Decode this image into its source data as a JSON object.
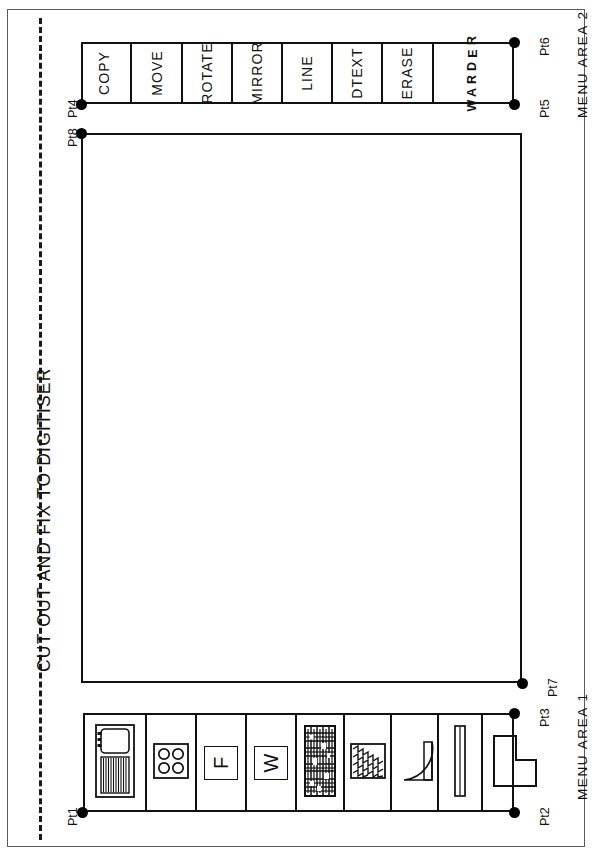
{
  "sheet": {
    "cut_instruction": "CUT OUT AND FIX TO DIGITISER",
    "screen_area_label": "SCREEN DRAWING AREA",
    "menu_area_1_label": "MENU  AREA  1",
    "menu_area_2_label": "MENU  AREA  2",
    "border_color": "#5a5a5a",
    "line_color": "#111111",
    "background": "#ffffff"
  },
  "calibration_points": [
    {
      "id": "pt1",
      "label": "Pt1"
    },
    {
      "id": "pt2",
      "label": "Pt2"
    },
    {
      "id": "pt3",
      "label": "Pt3"
    },
    {
      "id": "pt4",
      "label": "Pt4"
    },
    {
      "id": "pt5",
      "label": "Pt5"
    },
    {
      "id": "pt6",
      "label": "Pt6"
    },
    {
      "id": "pt7",
      "label": "Pt7"
    },
    {
      "id": "pt8",
      "label": "Pt8"
    }
  ],
  "menu_area_2": {
    "title": "MENU  AREA  2",
    "commands": [
      {
        "label": "COPY",
        "style": "text"
      },
      {
        "label": "MOVE",
        "style": "text"
      },
      {
        "label": "ROTATE",
        "style": "text"
      },
      {
        "label": "MIRROR",
        "style": "text"
      },
      {
        "label": "LINE",
        "style": "text"
      },
      {
        "label": "DTEXT",
        "style": "text"
      },
      {
        "label": "ERASE",
        "style": "text"
      },
      {
        "label": "REDRAW",
        "style": "stacked"
      }
    ]
  },
  "menu_area_1": {
    "title": "MENU  AREA  1",
    "symbols": [
      {
        "name": "cooker-symbol",
        "letter": ""
      },
      {
        "name": "hob-symbol",
        "letter": ""
      },
      {
        "name": "fridge-symbol",
        "letter": "F"
      },
      {
        "name": "washer-symbol",
        "letter": "W"
      },
      {
        "name": "dense-hatch-symbol",
        "letter": ""
      },
      {
        "name": "zigzag-hatch-symbol",
        "letter": ""
      },
      {
        "name": "door-swing-symbol",
        "letter": ""
      },
      {
        "name": "window-symbol",
        "letter": ""
      },
      {
        "name": "l-shape-symbol",
        "letter": ""
      }
    ]
  }
}
